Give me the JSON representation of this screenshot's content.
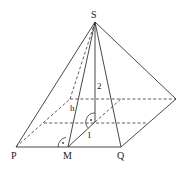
{
  "diagram": {
    "type": "square-pyramid",
    "vertices": {
      "apex": {
        "label": "S"
      },
      "front_left": {
        "label": "P"
      },
      "front_midpoint": {
        "label": "M"
      },
      "front_right": {
        "label": "Q"
      }
    },
    "measurements": {
      "slant_height_label": "h",
      "height_label": "2",
      "half_base_label": "1"
    },
    "right_angle_marks": [
      "at M between MP and MS",
      "at base center between SO and OM"
    ],
    "colors": {
      "line": "#333333",
      "background": "#ffffff"
    }
  }
}
